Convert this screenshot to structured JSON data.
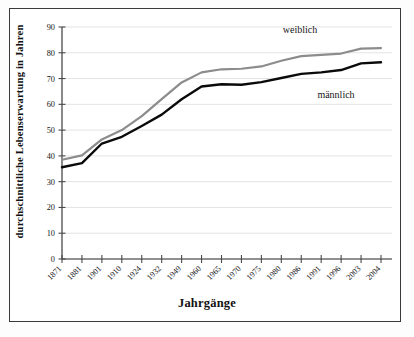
{
  "chart_data": {
    "type": "line",
    "title": "",
    "xlabel": "Jahrgänge",
    "ylabel": "durchschnittliche Lebenserwartung in Jahren",
    "ylim": [
      0,
      90
    ],
    "yticks": [
      0,
      10,
      20,
      30,
      40,
      50,
      60,
      70,
      80,
      90
    ],
    "grid": true,
    "legend_position": "inline-annotation",
    "categories": [
      "1871",
      "1881",
      "1901",
      "1910",
      "1924",
      "1932",
      "1949",
      "1960",
      "1965",
      "1970",
      "1975",
      "1980",
      "1986",
      "1991",
      "1996",
      "2003",
      "2004"
    ],
    "series": [
      {
        "name": "weiblich",
        "color": "#8c8c8c",
        "values": [
          38.5,
          40.2,
          46.4,
          50.0,
          55.4,
          62.0,
          68.5,
          72.4,
          73.6,
          73.8,
          74.7,
          76.9,
          78.7,
          79.2,
          79.7,
          81.6,
          81.8
        ]
      },
      {
        "name": "männlich",
        "color": "#0a0a0a",
        "values": [
          35.6,
          37.2,
          44.8,
          47.4,
          51.6,
          56.0,
          62.0,
          66.9,
          67.8,
          67.6,
          68.6,
          70.2,
          71.8,
          72.4,
          73.3,
          75.9,
          76.3
        ]
      }
    ],
    "annotations": [
      {
        "text": "weiblich",
        "x": 300,
        "y": 33
      },
      {
        "text": "männlich",
        "x": 336,
        "y": 98
      }
    ]
  },
  "axis": {
    "x_title": "Jahrgänge",
    "y_title": "durchschnittliche Lebenserwartung in Jahren"
  }
}
